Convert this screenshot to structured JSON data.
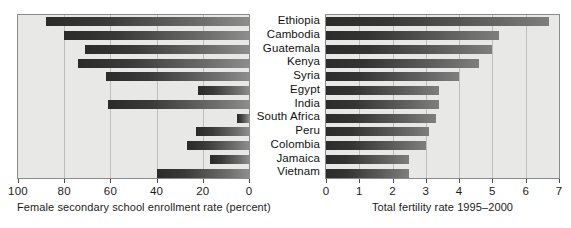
{
  "chart_data": {
    "type": "bar",
    "orientation": "horizontal",
    "title": "",
    "categories": [
      "Ethiopia",
      "Cambodia",
      "Guatemala",
      "Kenya",
      "Syria",
      "Egypt",
      "India",
      "South Africa",
      "Peru",
      "Colombia",
      "Jamaica",
      "Vietnam"
    ],
    "panels": [
      {
        "id": "enrollment",
        "xlabel": "Female secondary school enrollment rate (percent)",
        "ylabel": "",
        "xlim": [
          100,
          0
        ],
        "reversed": true,
        "ticks": [
          100,
          80,
          60,
          40,
          20,
          0
        ],
        "tick_labels": [
          "100",
          "80",
          "60",
          "40",
          "20",
          "0"
        ],
        "grid": true,
        "values": [
          12,
          20,
          29,
          26,
          38,
          78,
          39,
          95,
          77,
          73,
          83,
          60
        ]
      },
      {
        "id": "fertility",
        "xlabel": "Total fertility rate 1995–2000",
        "ylabel": "",
        "xlim": [
          0,
          7
        ],
        "reversed": false,
        "ticks": [
          0,
          1,
          2,
          3,
          4,
          5,
          6,
          7
        ],
        "tick_labels": [
          "0",
          "1",
          "2",
          "3",
          "4",
          "5",
          "6",
          "7"
        ],
        "grid": true,
        "values": [
          6.7,
          5.2,
          5.0,
          4.6,
          4.0,
          3.4,
          3.4,
          3.3,
          3.1,
          3.0,
          2.5,
          2.5
        ]
      }
    ],
    "legend": [],
    "colors": {
      "plot_background": "#e8e8e6",
      "plot_border": "#8a8a88",
      "gridline": "#bdbdbb",
      "bar_dark": "#2b2b2b",
      "bar_light": "#8d8d8d",
      "text": "#111111",
      "page_background": "#ffffff"
    }
  }
}
